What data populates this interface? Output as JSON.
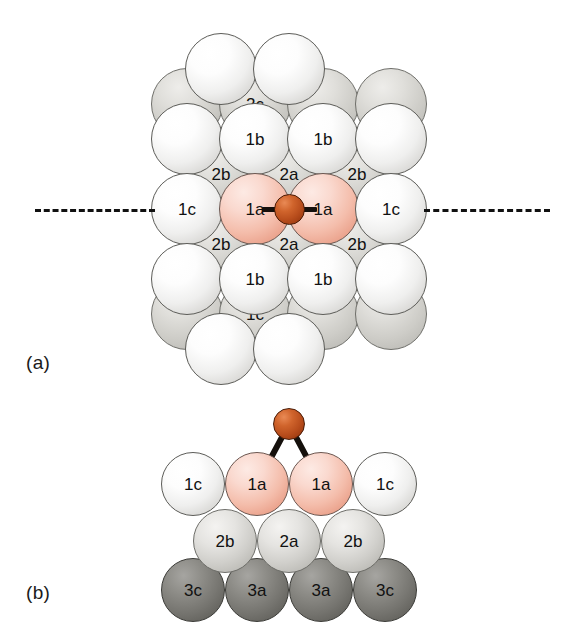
{
  "figure": {
    "type": "scientific-diagram",
    "background_color": "#ffffff",
    "panels": [
      {
        "id": "a",
        "label": "(a)",
        "view": "top-view"
      },
      {
        "id": "b",
        "label": "(b)",
        "view": "side-view"
      }
    ]
  },
  "legend_colors": {
    "layer1_white": "#f0efee",
    "layer1_highlight_pink": "#f4bdab",
    "layer2_gray": "#d0cfcb",
    "layer3_dark_gray": "#75746f",
    "adatom_red": "#b84d1c",
    "outline": "#5c5c58",
    "text": "#111111",
    "dashed_line": "#111111"
  },
  "panel_a": {
    "label": "(a)",
    "section_line": {
      "style": "dashed",
      "orientation": "horizontal"
    },
    "adatom": {
      "label": "",
      "color": "#b84d1c",
      "site": "bridge"
    },
    "atoms": [
      {
        "id": "a-l1-r0-c0",
        "layer": 1,
        "label": "",
        "cx": 221,
        "cy": 69,
        "r": 36,
        "kind": "l1"
      },
      {
        "id": "a-l1-r0-c1",
        "layer": 1,
        "label": "",
        "cx": 289,
        "cy": 69,
        "r": 36,
        "kind": "l1"
      },
      {
        "id": "a-l1-r1-c0",
        "layer": 1,
        "label": "",
        "cx": 187,
        "cy": 139,
        "r": 36,
        "kind": "l1"
      },
      {
        "id": "a-l1-r1-c1",
        "layer": 1,
        "label": "1b",
        "cx": 255,
        "cy": 139,
        "r": 36,
        "kind": "l1"
      },
      {
        "id": "a-l1-r1-c2",
        "layer": 1,
        "label": "1b",
        "cx": 323,
        "cy": 139,
        "r": 36,
        "kind": "l1"
      },
      {
        "id": "a-l1-r1-c3",
        "layer": 1,
        "label": "",
        "cx": 391,
        "cy": 139,
        "r": 36,
        "kind": "l1"
      },
      {
        "id": "a-l1-r2-c0",
        "layer": 1,
        "label": "1c",
        "cx": 187,
        "cy": 209,
        "r": 36,
        "kind": "l1"
      },
      {
        "id": "a-l1-r2-c1",
        "layer": 1,
        "label": "1a",
        "cx": 255,
        "cy": 209,
        "r": 36,
        "kind": "l1a"
      },
      {
        "id": "a-l1-r2-c2",
        "layer": 1,
        "label": "1a",
        "cx": 323,
        "cy": 209,
        "r": 36,
        "kind": "l1a"
      },
      {
        "id": "a-l1-r2-c3",
        "layer": 1,
        "label": "1c",
        "cx": 391,
        "cy": 209,
        "r": 36,
        "kind": "l1"
      },
      {
        "id": "a-l1-r3-c0",
        "layer": 1,
        "label": "",
        "cx": 187,
        "cy": 279,
        "r": 36,
        "kind": "l1"
      },
      {
        "id": "a-l1-r3-c1",
        "layer": 1,
        "label": "1b",
        "cx": 255,
        "cy": 279,
        "r": 36,
        "kind": "l1"
      },
      {
        "id": "a-l1-r3-c2",
        "layer": 1,
        "label": "1b",
        "cx": 323,
        "cy": 279,
        "r": 36,
        "kind": "l1"
      },
      {
        "id": "a-l1-r3-c3",
        "layer": 1,
        "label": "",
        "cx": 391,
        "cy": 279,
        "r": 36,
        "kind": "l1"
      },
      {
        "id": "a-l1-r4-c0",
        "layer": 1,
        "label": "",
        "cx": 221,
        "cy": 349,
        "r": 36,
        "kind": "l1"
      },
      {
        "id": "a-l1-r4-c1",
        "layer": 1,
        "label": "",
        "cx": 289,
        "cy": 349,
        "r": 36,
        "kind": "l1"
      }
    ],
    "sublayer_atoms": [
      {
        "id": "a-l2-r0-c0",
        "layer": 2,
        "label": "",
        "cx": 187,
        "cy": 104,
        "r": 36,
        "kind": "l2bg"
      },
      {
        "id": "a-l2-r0-c1",
        "layer": 2,
        "label": "2c",
        "cx": 255,
        "cy": 104,
        "r": 36,
        "kind": "l2bg"
      },
      {
        "id": "a-l2-r0-c2",
        "layer": 2,
        "label": "",
        "cx": 323,
        "cy": 104,
        "r": 36,
        "kind": "l2bg"
      },
      {
        "id": "a-l2-r0-c3",
        "layer": 2,
        "label": "",
        "cx": 391,
        "cy": 104,
        "r": 36,
        "kind": "l2bg"
      },
      {
        "id": "a-l2-r1-c0",
        "layer": 2,
        "label": "2b",
        "cx": 221,
        "cy": 174,
        "r": 36,
        "kind": "l2bg"
      },
      {
        "id": "a-l2-r1-c1",
        "layer": 2,
        "label": "2a",
        "cx": 289,
        "cy": 174,
        "r": 36,
        "kind": "l2bg"
      },
      {
        "id": "a-l2-r1-c2",
        "layer": 2,
        "label": "2b",
        "cx": 357,
        "cy": 174,
        "r": 36,
        "kind": "l2bg"
      },
      {
        "id": "a-l2-r2-c0",
        "layer": 2,
        "label": "2b",
        "cx": 221,
        "cy": 244,
        "r": 36,
        "kind": "l2bg"
      },
      {
        "id": "a-l2-r2-c1",
        "layer": 2,
        "label": "2a",
        "cx": 289,
        "cy": 244,
        "r": 36,
        "kind": "l2bg"
      },
      {
        "id": "a-l2-r2-c2",
        "layer": 2,
        "label": "2b",
        "cx": 357,
        "cy": 244,
        "r": 36,
        "kind": "l2bg"
      },
      {
        "id": "a-l2-r3-c0",
        "layer": 2,
        "label": "",
        "cx": 187,
        "cy": 314,
        "r": 36,
        "kind": "l2bg"
      },
      {
        "id": "a-l2-r3-c1",
        "layer": 2,
        "label": "1c",
        "cx": 255,
        "cy": 314,
        "r": 36,
        "kind": "l2bg"
      },
      {
        "id": "a-l2-r3-c2",
        "layer": 2,
        "label": "",
        "cx": 323,
        "cy": 314,
        "r": 36,
        "kind": "l2bg"
      },
      {
        "id": "a-l2-r3-c3",
        "layer": 2,
        "label": "",
        "cx": 391,
        "cy": 314,
        "r": 36,
        "kind": "l2bg"
      }
    ]
  },
  "panel_b": {
    "label": "(b)",
    "adatom": {
      "label": "",
      "color": "#b84d1c",
      "cx": 289,
      "cy": 424,
      "r": 16
    },
    "bonds": [
      {
        "from": "adatom",
        "to": "1a-left"
      },
      {
        "from": "adatom",
        "to": "1a-right"
      }
    ],
    "rows": [
      {
        "layer": 1,
        "atoms": [
          {
            "id": "b-l1-c0",
            "label": "1c",
            "cx": 193,
            "cy": 484,
            "r": 32,
            "kind": "l1"
          },
          {
            "id": "b-l1-c1",
            "label": "1a",
            "cx": 257,
            "cy": 484,
            "r": 32,
            "kind": "l1a"
          },
          {
            "id": "b-l1-c2",
            "label": "1a",
            "cx": 321,
            "cy": 484,
            "r": 32,
            "kind": "l1a"
          },
          {
            "id": "b-l1-c3",
            "label": "1c",
            "cx": 385,
            "cy": 484,
            "r": 32,
            "kind": "l1"
          }
        ]
      },
      {
        "layer": 2,
        "atoms": [
          {
            "id": "b-l2-c0",
            "label": "2b",
            "cx": 225,
            "cy": 541,
            "r": 32,
            "kind": "l2"
          },
          {
            "id": "b-l2-c1",
            "label": "2a",
            "cx": 289,
            "cy": 541,
            "r": 32,
            "kind": "l2"
          },
          {
            "id": "b-l2-c2",
            "label": "2b",
            "cx": 353,
            "cy": 541,
            "r": 32,
            "kind": "l2"
          }
        ]
      },
      {
        "layer": 3,
        "atoms": [
          {
            "id": "b-l3-c0",
            "label": "3c",
            "cx": 193,
            "cy": 590,
            "r": 32,
            "kind": "l3"
          },
          {
            "id": "b-l3-c1",
            "label": "3a",
            "cx": 257,
            "cy": 590,
            "r": 32,
            "kind": "l3"
          },
          {
            "id": "b-l3-c2",
            "label": "3a",
            "cx": 321,
            "cy": 590,
            "r": 32,
            "kind": "l3"
          },
          {
            "id": "b-l3-c3",
            "label": "3c",
            "cx": 385,
            "cy": 590,
            "r": 32,
            "kind": "l3"
          }
        ]
      }
    ]
  }
}
